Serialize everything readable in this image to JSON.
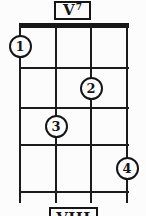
{
  "diagram": {
    "type": "chord-fingering-chart",
    "title": "V",
    "title_superscript": "7",
    "next_title": "VIII",
    "strings_count": 4,
    "frets_count": 4,
    "fingerings": [
      {
        "finger": "1",
        "string": 1,
        "fret": 1
      },
      {
        "finger": "2",
        "string": 3,
        "fret": 2
      },
      {
        "finger": "3",
        "string": 2,
        "fret": 3
      },
      {
        "finger": "4",
        "string": 4,
        "fret": 4
      }
    ],
    "colors": {
      "ink": "#161616",
      "background": "#fcfcfc"
    }
  }
}
